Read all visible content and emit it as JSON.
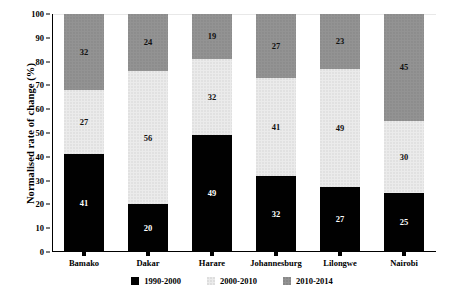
{
  "chart_data": {
    "type": "bar",
    "subtype": "stacked-bar-100",
    "title": "",
    "xlabel": "",
    "ylabel": "Normalised rate of change (%)",
    "ylim": [
      0,
      100
    ],
    "yticks": [
      0,
      10,
      20,
      30,
      40,
      50,
      60,
      70,
      80,
      90,
      100
    ],
    "grid": false,
    "legend_position": "bottom",
    "categories": [
      "Bamako",
      "Dakar",
      "Harare",
      "Johannesburg",
      "Lilongwe",
      "Nairobi"
    ],
    "series": [
      {
        "name": "1990-2000",
        "color": "#010101",
        "values": [
          41,
          20,
          49,
          32,
          27,
          25
        ]
      },
      {
        "name": "2000-2010",
        "color": "#ebebeb",
        "values": [
          27,
          56,
          32,
          41,
          49,
          30
        ]
      },
      {
        "name": "2010-2014",
        "color": "#939393",
        "values": [
          32,
          24,
          19,
          27,
          23,
          45
        ]
      }
    ]
  }
}
